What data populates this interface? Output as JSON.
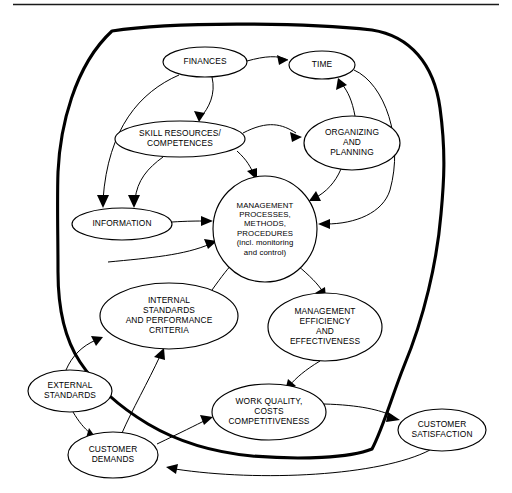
{
  "figure": {
    "type": "influence-diagram",
    "top_rule": true,
    "boundary_label": "system-boundary-blob",
    "background": "#ffffff",
    "stroke_color": "#000000"
  },
  "nodes": [
    {
      "id": "finances",
      "name": "node-finances",
      "lines": [
        "FINANCES"
      ],
      "cx": 205,
      "cy": 62,
      "rx": 42,
      "ry": 15
    },
    {
      "id": "time",
      "name": "node-time",
      "lines": [
        "TIME"
      ],
      "cx": 322,
      "cy": 65,
      "rx": 33,
      "ry": 14
    },
    {
      "id": "skill-resources",
      "name": "node-skill-resources-competences",
      "lines": [
        "SKILL RESOURCES/",
        "COMPETENCES"
      ],
      "cx": 180,
      "cy": 139,
      "rx": 65,
      "ry": 18
    },
    {
      "id": "organizing-planning",
      "name": "node-organizing-and-planning",
      "lines": [
        "ORGANIZING",
        "AND",
        "PLANNING"
      ],
      "cx": 352,
      "cy": 143,
      "rx": 48,
      "ry": 27
    },
    {
      "id": "management-processes",
      "name": "node-management-processes",
      "lines": [
        "MANAGEMENT",
        "PROCESSES,",
        "METHODS,",
        "PROCEDURES",
        "(incl. monitoring",
        "and control)"
      ],
      "cx": 265,
      "cy": 229,
      "rx": 52,
      "ry": 53
    },
    {
      "id": "information",
      "name": "node-information",
      "lines": [
        "INFORMATION"
      ],
      "cx": 122,
      "cy": 224,
      "rx": 50,
      "ry": 16
    },
    {
      "id": "internal-standards",
      "name": "node-internal-standards",
      "lines": [
        "INTERNAL",
        "STANDARDS",
        "AND PERFORMANCE",
        "CRITERIA"
      ],
      "cx": 169,
      "cy": 316,
      "rx": 69,
      "ry": 33
    },
    {
      "id": "management-efficiency",
      "name": "node-management-efficiency",
      "lines": [
        "MANAGEMENT",
        "EFFICIENCY",
        "AND",
        "EFFECTIVENESS"
      ],
      "cx": 325,
      "cy": 327,
      "rx": 57,
      "ry": 34
    },
    {
      "id": "external-standards",
      "name": "node-external-standards",
      "lines": [
        "EXTERNAL",
        "STANDARDS"
      ],
      "cx": 70,
      "cy": 391,
      "rx": 42,
      "ry": 21
    },
    {
      "id": "work-quality",
      "name": "node-work-quality-costs-competitiveness",
      "lines": [
        "WORK QUALITY,",
        "COSTS",
        "COMPETITIVENESS"
      ],
      "cx": 269,
      "cy": 412,
      "rx": 57,
      "ry": 28
    },
    {
      "id": "customer-demands",
      "name": "node-customer-demands",
      "lines": [
        "CUSTOMER",
        "DEMANDS"
      ],
      "cx": 113,
      "cy": 455,
      "rx": 45,
      "ry": 23
    },
    {
      "id": "customer-satisfaction",
      "name": "node-customer-satisfaction",
      "lines": [
        "CUSTOMER",
        "SATISFACTION"
      ],
      "cx": 442,
      "cy": 430,
      "rx": 44,
      "ry": 21
    }
  ],
  "edges": [
    {
      "from": "finances",
      "to": "time",
      "name": "edge-finances-time"
    },
    {
      "from": "finances",
      "to": "skill-resources",
      "name": "edge-finances-skill-resources"
    },
    {
      "from": "finances",
      "to": "information",
      "name": "edge-finances-information"
    },
    {
      "from": "skill-resources",
      "to": "organizing-planning",
      "name": "edge-skill-resources-organizing-planning"
    },
    {
      "from": "skill-resources",
      "to": "management-processes",
      "name": "edge-skill-resources-management-processes"
    },
    {
      "from": "skill-resources",
      "to": "information",
      "name": "edge-skill-resources-information"
    },
    {
      "from": "organizing-planning",
      "to": "time",
      "name": "edge-organizing-planning-time"
    },
    {
      "from": "organizing-planning",
      "to": "management-processes",
      "name": "edge-organizing-planning-management-processes"
    },
    {
      "from": "time",
      "to": "management-processes",
      "name": "edge-time-management-processes"
    },
    {
      "from": "information",
      "to": "management-processes",
      "name": "edge-information-management-processes"
    },
    {
      "from": "internal-standards",
      "to": "management-processes",
      "name": "edge-internal-standards-management-processes"
    },
    {
      "from": "management-processes",
      "to": "internal-standards",
      "name": "edge-management-processes-internal-standards"
    },
    {
      "from": "management-processes",
      "to": "management-efficiency",
      "name": "edge-management-processes-management-efficiency"
    },
    {
      "from": "management-efficiency",
      "to": "work-quality",
      "name": "edge-management-efficiency-work-quality"
    },
    {
      "from": "external-standards",
      "to": "internal-standards",
      "name": "edge-external-standards-internal-standards"
    },
    {
      "from": "external-standards",
      "to": "customer-demands",
      "name": "edge-external-standards-customer-demands"
    },
    {
      "from": "customer-demands",
      "to": "internal-standards",
      "name": "edge-customer-demands-internal-standards"
    },
    {
      "from": "customer-demands",
      "to": "work-quality",
      "name": "edge-customer-demands-work-quality"
    },
    {
      "from": "work-quality",
      "to": "customer-satisfaction",
      "name": "edge-work-quality-customer-satisfaction"
    },
    {
      "from": "customer-satisfaction",
      "to": "customer-demands",
      "name": "edge-customer-satisfaction-customer-demands"
    }
  ]
}
